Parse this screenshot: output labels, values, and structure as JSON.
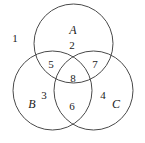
{
  "figure": {
    "type": "venn-diagram-3-set",
    "stroke_color": "#4a4a4a",
    "background_color": "#ffffff",
    "text_color": "#1b1b1b"
  },
  "sets": [
    {
      "name": "A",
      "position": "top",
      "cx": 73.5,
      "cy": 43.5,
      "r": 39.5,
      "label_x": 73,
      "label_y": 30
    },
    {
      "name": "B",
      "position": "bottom-left",
      "cx": 52.5,
      "cy": 90.5,
      "r": 39.5,
      "label_x": 32,
      "label_y": 104
    },
    {
      "name": "C",
      "position": "bottom-right",
      "cx": 93.5,
      "cy": 90.5,
      "r": 39.5,
      "label_x": 116,
      "label_y": 104
    }
  ],
  "regions": [
    {
      "number": "1",
      "meaning": "outside-all",
      "x": 15,
      "y": 38
    },
    {
      "number": "2",
      "meaning": "A-only-lower",
      "x": 72,
      "y": 45
    },
    {
      "number": "3",
      "meaning": "B-only",
      "x": 44,
      "y": 95
    },
    {
      "number": "4",
      "meaning": "C-only",
      "x": 103,
      "y": 95
    },
    {
      "number": "5",
      "meaning": "A-and-B-only",
      "x": 51,
      "y": 64
    },
    {
      "number": "6",
      "meaning": "B-and-C-only",
      "x": 72,
      "y": 106
    },
    {
      "number": "7",
      "meaning": "A-and-C-only",
      "x": 95,
      "y": 64
    },
    {
      "number": "8",
      "meaning": "A-and-B-and-C",
      "x": 73,
      "y": 78
    }
  ]
}
